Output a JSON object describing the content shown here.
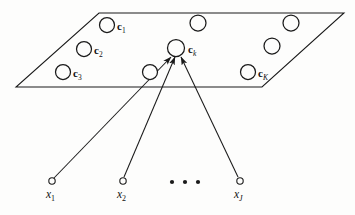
{
  "figure": {
    "background_color": "#fdfdfc",
    "stroke_color": "#1a1a1a",
    "plane": {
      "name": "prototype-plane",
      "points": "99,13 344,13 262,87 16,87"
    },
    "prototypes": [
      {
        "id": "c1",
        "label_base": "c",
        "label_sub": "1",
        "sub_italic": false,
        "cx": 107,
        "cy": 25,
        "r": 7.5,
        "label_x": 117,
        "label_y": 21,
        "has_label": true
      },
      {
        "id": "c2",
        "label_base": "c",
        "label_sub": "2",
        "sub_italic": false,
        "cx": 84,
        "cy": 49,
        "r": 7.5,
        "label_x": 94,
        "label_y": 45,
        "has_label": true
      },
      {
        "id": "c3",
        "label_base": "c",
        "label_sub": "3",
        "sub_italic": false,
        "cx": 63,
        "cy": 72,
        "r": 7.5,
        "label_x": 73,
        "label_y": 68,
        "has_label": true
      },
      {
        "id": "top-mid",
        "label_base": "",
        "label_sub": "",
        "sub_italic": false,
        "cx": 198,
        "cy": 23,
        "r": 8,
        "label_x": 0,
        "label_y": 0,
        "has_label": false
      },
      {
        "id": "top-right",
        "label_base": "",
        "label_sub": "",
        "sub_italic": false,
        "cx": 291,
        "cy": 23,
        "r": 8,
        "label_x": 0,
        "label_y": 0,
        "has_label": false
      },
      {
        "id": "ck",
        "label_base": "c",
        "label_sub": "k",
        "sub_italic": true,
        "cx": 176,
        "cy": 48,
        "r": 8.5,
        "label_x": 188,
        "label_y": 44,
        "has_label": true
      },
      {
        "id": "mid-right",
        "label_base": "",
        "label_sub": "",
        "sub_italic": false,
        "cx": 272,
        "cy": 46,
        "r": 8,
        "label_x": 0,
        "label_y": 0,
        "has_label": false
      },
      {
        "id": "low-mid",
        "label_base": "",
        "label_sub": "",
        "sub_italic": false,
        "cx": 150,
        "cy": 72,
        "r": 7.5,
        "label_x": 0,
        "label_y": 0,
        "has_label": false
      },
      {
        "id": "cK",
        "label_base": "c",
        "label_sub": "K",
        "sub_italic": true,
        "cx": 248,
        "cy": 72,
        "r": 7.5,
        "label_x": 258,
        "label_y": 68,
        "has_label": true
      }
    ],
    "data_points": [
      {
        "id": "x1",
        "label_base": "x",
        "label_sub": "1",
        "sub_italic": false,
        "cx": 52,
        "cy": 181,
        "r": 3.2,
        "label_x": 46,
        "label_y": 189
      },
      {
        "id": "x2",
        "label_base": "x",
        "label_sub": "2",
        "sub_italic": false,
        "cx": 123,
        "cy": 181,
        "r": 3.2,
        "label_x": 117,
        "label_y": 189
      },
      {
        "id": "xJ",
        "label_base": "x",
        "label_sub": "J",
        "sub_italic": true,
        "cx": 240,
        "cy": 181,
        "r": 3.2,
        "label_x": 234,
        "label_y": 189
      }
    ],
    "arrows": [
      {
        "id": "arrow-x1-ck",
        "x1": 54,
        "y1": 178,
        "x2": 171,
        "y2": 57
      },
      {
        "id": "arrow-x2-ck",
        "x1": 124,
        "y1": 177,
        "x2": 175,
        "y2": 57
      },
      {
        "id": "arrow-xJ-ck",
        "x1": 238,
        "y1": 177,
        "x2": 181,
        "y2": 57
      }
    ],
    "ellipsis_dots": [
      {
        "cx": 172,
        "cy": 182,
        "r": 2.1
      },
      {
        "cx": 185,
        "cy": 182,
        "r": 2.1
      },
      {
        "cx": 198,
        "cy": 182,
        "r": 2.1
      }
    ]
  }
}
